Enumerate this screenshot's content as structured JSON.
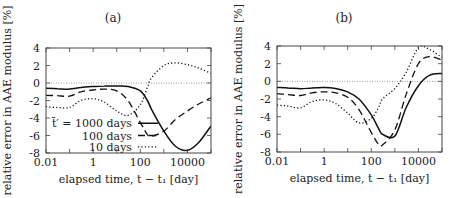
{
  "figure": {
    "panels": [
      "(a)",
      "(b)"
    ]
  },
  "chart_data": [
    {
      "type": "line",
      "title": "(a)",
      "xlabel": "elapsed time, t − t₁ [day]",
      "ylabel": "relative error in AAE modulus [%]",
      "xscale": "log",
      "xlim": [
        0.01,
        100000
      ],
      "ylim": [
        -8,
        4
      ],
      "xticks": [
        "0.01",
        "1",
        "100",
        "10000"
      ],
      "yticks": [
        "4",
        "2",
        "0",
        "-2",
        "-4",
        "-6",
        "-8"
      ],
      "reference_line": {
        "y": 0,
        "style": "dotted",
        "color": "#999999"
      },
      "legend": {
        "position": "lower left",
        "entries": [
          "t̄′ = 1000 days",
          "100 days",
          "10 days"
        ]
      },
      "x": [
        0.01,
        0.03,
        0.1,
        0.3,
        1,
        3,
        10,
        30,
        100,
        200,
        300,
        1000,
        3000,
        10000,
        30000,
        100000
      ],
      "series": [
        {
          "name": "t̄′ = 1000 days",
          "style": "solid",
          "values": [
            -0.6,
            -0.65,
            -0.7,
            -0.5,
            -0.4,
            -0.35,
            -0.35,
            -0.4,
            -0.9,
            -2.0,
            -3.0,
            -5.5,
            -7.2,
            -7.7,
            -6.8,
            -4.9
          ]
        },
        {
          "name": "100 days",
          "style": "dashed",
          "values": [
            -1.4,
            -1.45,
            -1.5,
            -1.0,
            -0.8,
            -0.7,
            -0.9,
            -2.0,
            -4.5,
            -5.9,
            -6.1,
            -5.5,
            -4.2,
            -3.2,
            -2.4,
            -1.7
          ]
        },
        {
          "name": "10 days",
          "style": "dotted",
          "values": [
            -2.7,
            -2.8,
            -2.8,
            -2.0,
            -1.8,
            -2.2,
            -3.2,
            -3.7,
            -2.5,
            -0.5,
            0.6,
            2.0,
            2.3,
            2.1,
            1.7,
            1.1
          ]
        }
      ]
    },
    {
      "type": "line",
      "title": "(b)",
      "xlabel": "elapsed time, t − t₁ [day]",
      "ylabel": "relative error in AAE modulus [%]",
      "xscale": "log",
      "xlim": [
        0.01,
        100000
      ],
      "ylim": [
        -8,
        4
      ],
      "xticks": [
        "0.01",
        "1",
        "100",
        "10000"
      ],
      "yticks": [
        "4",
        "2",
        "0",
        "-2",
        "-4",
        "-6",
        "-8"
      ],
      "reference_line": {
        "y": 0,
        "style": "dotted",
        "color": "#999999"
      },
      "x": [
        0.01,
        0.03,
        0.1,
        0.3,
        1,
        3,
        10,
        30,
        100,
        200,
        300,
        1000,
        3000,
        10000,
        30000,
        100000
      ],
      "series": [
        {
          "name": "t̄′ = 1000 days",
          "style": "solid",
          "values": [
            -0.7,
            -0.75,
            -0.85,
            -0.75,
            -0.7,
            -0.8,
            -1.2,
            -2.0,
            -3.8,
            -5.3,
            -6.0,
            -6.2,
            -3.0,
            -0.5,
            0.7,
            0.9
          ]
        },
        {
          "name": "100 days",
          "style": "dashed",
          "values": [
            -1.4,
            -1.5,
            -1.6,
            -1.3,
            -1.2,
            -1.3,
            -1.8,
            -3.2,
            -5.8,
            -7.1,
            -7.2,
            -5.5,
            -1.5,
            2.0,
            2.8,
            2.4
          ]
        },
        {
          "name": "10 days",
          "style": "dotted",
          "values": [
            -2.7,
            -2.8,
            -3.0,
            -2.3,
            -2.1,
            -2.5,
            -3.6,
            -4.7,
            -4.2,
            -3.0,
            -2.0,
            -0.8,
            1.0,
            3.8,
            3.6,
            2.7
          ]
        }
      ]
    }
  ]
}
